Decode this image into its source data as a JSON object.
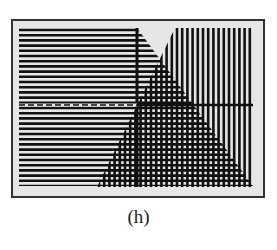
{
  "figure": {
    "caption": "(h)",
    "colors": {
      "screen_bg": "#e6e6e6",
      "ink": "#111111",
      "frame": "#333333"
    }
  },
  "chart_data": {
    "type": "inequality-shading",
    "title": "",
    "axes": {
      "x_axis": {
        "style_left": "dashed",
        "style_right": "solid"
      },
      "y_axis": {
        "style": "solid"
      }
    },
    "regions": [
      {
        "name": "inequality-1",
        "pattern": "horizontal-lines",
        "side": "left of decreasing line",
        "boundary": "decreasing line from top near y-axis to bottom-right"
      },
      {
        "name": "inequality-2",
        "pattern": "vertical-lines",
        "side": "right of increasing line",
        "boundary": "increasing line from bottom-left to top right of y-axis"
      },
      {
        "name": "intersection",
        "pattern": "grid (both)",
        "shape": "triangle below vertex"
      }
    ],
    "grid": false,
    "legend": null
  }
}
